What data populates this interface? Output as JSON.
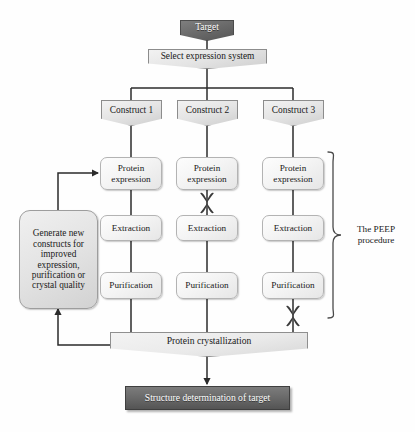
{
  "diagram": {
    "colors": {
      "dark_fill": "#6a6a6a",
      "light_fill": "#e8e8e8",
      "border": "#8c8c8c",
      "edge": "#2b2b2b",
      "text_dark": "#1a1a1a",
      "text_light": "#ffffff",
      "xmark": "#3a3a3a"
    }
  },
  "nodes": {
    "target": {
      "label": "Target",
      "shape": "banner-dark"
    },
    "select_expression": {
      "label": "Select expression system",
      "shape": "banner-light"
    },
    "construct_1": {
      "label": "Construct 1",
      "shape": "banner-light"
    },
    "construct_2": {
      "label": "Construct 2",
      "shape": "banner-light"
    },
    "construct_3": {
      "label": "Construct 3",
      "shape": "banner-light"
    },
    "protein_expression_1": {
      "label": "Protein expression",
      "shape": "rounded"
    },
    "protein_expression_2": {
      "label": "Protein expression",
      "shape": "rounded"
    },
    "protein_expression_3": {
      "label": "Protein expression",
      "shape": "rounded"
    },
    "extraction_1": {
      "label": "Extraction",
      "shape": "rounded"
    },
    "extraction_2": {
      "label": "Extraction",
      "shape": "rounded"
    },
    "extraction_3": {
      "label": "Extraction",
      "shape": "rounded"
    },
    "purification_1": {
      "label": "Purification",
      "shape": "rounded"
    },
    "purification_2": {
      "label": "Purification",
      "shape": "rounded"
    },
    "purification_3": {
      "label": "Purification",
      "shape": "rounded"
    },
    "generate_constructs": {
      "label": "Generate new constructs for improved expression, purification or crystal quality",
      "shape": "rounded-large"
    },
    "protein_crystallization": {
      "label": "Protein crystallization",
      "shape": "banner-wide"
    },
    "structure_determination": {
      "label": "Structure determination of target",
      "shape": "flat-dark"
    }
  },
  "annotations": {
    "peep_bracket": {
      "label": "The PEEP procedure",
      "line_1": "The PEEP",
      "line_2": "procedure"
    },
    "blocked_markers": [
      {
        "id": "x-construct-2-expression",
        "meaning": "failure between protein expression and extraction in construct 2"
      },
      {
        "id": "x-construct-3-purification",
        "meaning": "failure between purification and protein crystallization in construct 3"
      }
    ]
  }
}
